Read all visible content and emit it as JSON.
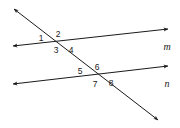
{
  "diagram": {
    "background_color": "#ffffff",
    "stroke_color": "#1a1a1a",
    "stroke_width": 1.0,
    "canvas": {
      "width": 180,
      "height": 128
    },
    "lines": [
      {
        "name": "line-m",
        "label": "m",
        "label_position": {
          "x": 167,
          "y": 47
        },
        "role": "parallel-line-upper",
        "x1": 13,
        "y1": 46,
        "x2": 168,
        "y2": 29,
        "arrow_start": true,
        "arrow_end": true
      },
      {
        "name": "line-n",
        "label": "n",
        "label_position": {
          "x": 167,
          "y": 84
        },
        "role": "parallel-line-lower",
        "x1": 13,
        "y1": 84,
        "x2": 168,
        "y2": 66,
        "arrow_start": true,
        "arrow_end": true
      },
      {
        "name": "transversal",
        "label": "",
        "label_position": null,
        "role": "transversal",
        "x1": 14,
        "y1": 9,
        "x2": 158,
        "y2": 120,
        "arrow_start": true,
        "arrow_end": true
      }
    ],
    "intersections": [
      {
        "name": "upper-intersection",
        "x": 61,
        "y": 44,
        "lines": [
          "line-m",
          "transversal"
        ]
      },
      {
        "name": "lower-intersection",
        "x": 100,
        "y": 78,
        "lines": [
          "line-n",
          "transversal"
        ]
      }
    ],
    "angle_labels": [
      {
        "id": "1",
        "text": "1",
        "x": 41,
        "y": 38,
        "at": "upper-intersection",
        "quadrant": "left"
      },
      {
        "id": "2",
        "text": "2",
        "x": 58,
        "y": 34,
        "at": "upper-intersection",
        "quadrant": "top"
      },
      {
        "id": "3",
        "text": "3",
        "x": 56,
        "y": 50,
        "at": "upper-intersection",
        "quadrant": "bottom"
      },
      {
        "id": "4",
        "text": "4",
        "x": 71,
        "y": 50,
        "at": "upper-intersection",
        "quadrant": "right"
      },
      {
        "id": "5",
        "text": "5",
        "x": 80,
        "y": 71,
        "at": "lower-intersection",
        "quadrant": "left"
      },
      {
        "id": "6",
        "text": "6",
        "x": 97,
        "y": 67,
        "at": "lower-intersection",
        "quadrant": "top"
      },
      {
        "id": "7",
        "text": "7",
        "x": 95,
        "y": 84,
        "at": "lower-intersection",
        "quadrant": "bottom"
      },
      {
        "id": "8",
        "text": "8",
        "x": 111,
        "y": 83,
        "at": "lower-intersection",
        "quadrant": "right"
      }
    ]
  }
}
